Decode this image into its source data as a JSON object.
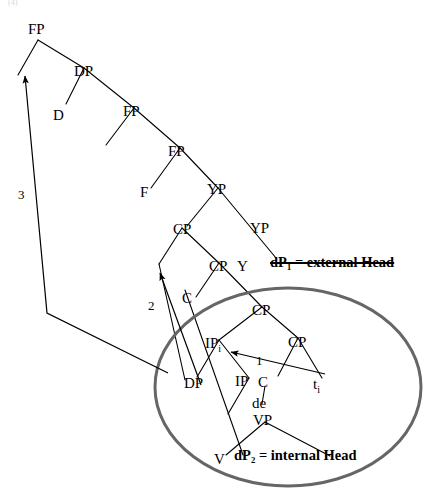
{
  "figure": {
    "title_fragment": "(4)",
    "type": "syntax-tree-diagram",
    "colors": {
      "ink": "#000000",
      "ellipse_stroke": "#666666",
      "background": "#ffffff"
    }
  },
  "nodes": [
    {
      "id": "n1",
      "label": "FP",
      "x": 28,
      "y": 22
    },
    {
      "id": "n2",
      "label": "DP",
      "x": 74,
      "y": 64
    },
    {
      "id": "n3",
      "label": "D",
      "x": 53,
      "y": 108
    },
    {
      "id": "n4",
      "label": "FP",
      "x": 123,
      "y": 104
    },
    {
      "id": "n5",
      "label": "FP",
      "x": 168,
      "y": 144
    },
    {
      "id": "n6",
      "label": "F",
      "x": 140,
      "y": 185
    },
    {
      "id": "n7",
      "label": "YP",
      "x": 207,
      "y": 182
    },
    {
      "id": "n8",
      "label": "CP",
      "x": 173,
      "y": 222
    },
    {
      "id": "n9",
      "label": "YP",
      "x": 250,
      "y": 221
    },
    {
      "id": "n10",
      "label": "CP",
      "x": 209,
      "y": 259
    },
    {
      "id": "n11",
      "label": "Y",
      "x": 237,
      "y": 259
    },
    {
      "id": "n12",
      "label": "C",
      "x": 182,
      "y": 291
    },
    {
      "id": "n13",
      "label": "CP",
      "x": 252,
      "y": 303
    },
    {
      "id": "n14",
      "label": "IP",
      "x": 205,
      "y": 336,
      "sub": "i"
    },
    {
      "id": "n15",
      "label": "CP",
      "x": 288,
      "y": 335
    },
    {
      "id": "n16",
      "label": "DP",
      "x": 184,
      "y": 376
    },
    {
      "id": "n17",
      "label": "IP",
      "x": 235,
      "y": 374
    },
    {
      "id": "n18",
      "label": "C",
      "x": 258,
      "y": 375
    },
    {
      "id": "n19",
      "label": "t",
      "x": 313,
      "y": 377,
      "sub": "i"
    },
    {
      "id": "n20",
      "label": "de",
      "x": 252,
      "y": 396
    },
    {
      "id": "n21",
      "label": "VP",
      "x": 253,
      "y": 413
    },
    {
      "id": "n22",
      "label": "V",
      "x": 214,
      "y": 452
    }
  ],
  "arrow_labels": [
    {
      "id": "a1",
      "label": "1",
      "x": 256,
      "y": 356
    },
    {
      "id": "a2",
      "label": "2",
      "x": 148,
      "y": 303
    },
    {
      "id": "a3",
      "label": "3",
      "x": 18,
      "y": 190
    }
  ],
  "annotations": [
    {
      "id": "external-head",
      "text": "dP₁ = external Head",
      "x": 270,
      "y": 257,
      "bold": true,
      "strikethrough": true
    },
    {
      "id": "internal-head",
      "text": "dP₂ = internal Head",
      "x": 234,
      "y": 451,
      "bold": true,
      "strikethrough": false
    }
  ],
  "ellipse": {
    "cx": 288,
    "cy": 387,
    "rx": 133,
    "ry": 99,
    "stroke": "#666666",
    "stroke_width": 3
  },
  "legend": {
    "arrow_1": "1",
    "arrow_2": "2",
    "arrow_3": "3"
  }
}
